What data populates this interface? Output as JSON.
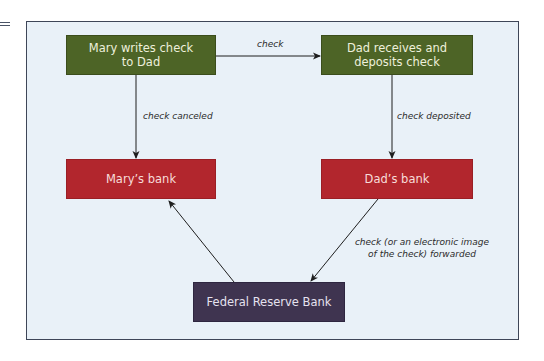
{
  "diagram": {
    "nodes": {
      "mary_writes": "Mary writes check\nto Dad",
      "mary_writes_line1": "Mary writes check",
      "mary_writes_line2": "to Dad",
      "dad_receives_line1": "Dad receives and",
      "dad_receives_line2": "deposits check",
      "marys_bank": "Mary’s bank",
      "dads_bank": "Dad’s bank",
      "federal_reserve": "Federal Reserve Bank"
    },
    "edges": {
      "check": "check",
      "check_canceled": "check canceled",
      "check_deposited": "check deposited",
      "forwarded_line1": "check (or an electronic image",
      "forwarded_line2": "of the check) forwarded"
    },
    "colors": {
      "frame_bg": "#e9f1f8",
      "frame_border": "#3e4658",
      "green": "#4d6426",
      "red": "#b2262d",
      "purple": "#3f3450",
      "arrow": "#1e1e1e"
    }
  }
}
